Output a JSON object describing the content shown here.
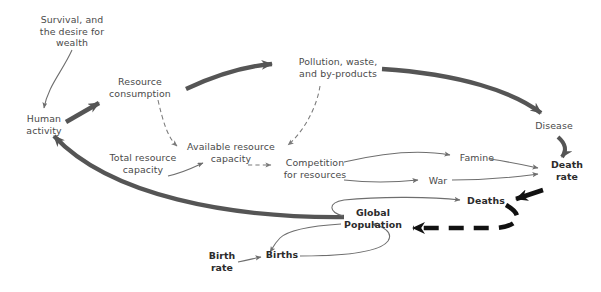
{
  "diagram": {
    "canvas": {
      "width": 601,
      "height": 292
    },
    "colors": {
      "background": "#ffffff",
      "thin_line": "#6e6e6e",
      "thick_gray": "#555555",
      "thick_black": "#111111",
      "dashed_line": "#7a7a7a",
      "text": "#4a4a4a",
      "text_bold": "#1d1d1d"
    },
    "nodes": [
      {
        "id": "survival",
        "label": "Survival, and\nthe desire for\nwealth",
        "x": 26,
        "y": 14,
        "w": 92,
        "weight": "normal"
      },
      {
        "id": "resource_cons",
        "label": "Resource\nconsumption",
        "x": 100,
        "y": 76,
        "w": 80,
        "weight": "normal"
      },
      {
        "id": "pollution",
        "label": "Pollution, waste,\nand by-products",
        "x": 288,
        "y": 56,
        "w": 100,
        "weight": "normal"
      },
      {
        "id": "human_act",
        "label": "Human\nactivity",
        "x": 18,
        "y": 113,
        "w": 52,
        "weight": "normal"
      },
      {
        "id": "disease",
        "label": "Disease",
        "x": 530,
        "y": 120,
        "w": 48,
        "weight": "normal"
      },
      {
        "id": "avail_res",
        "label": "Available resource\ncapacity",
        "x": 180,
        "y": 141,
        "w": 102,
        "weight": "normal"
      },
      {
        "id": "total_res",
        "label": "Total resource\ncapacity",
        "x": 103,
        "y": 152,
        "w": 80,
        "weight": "normal"
      },
      {
        "id": "competition",
        "label": "Competition\nfor resources",
        "x": 276,
        "y": 157,
        "w": 78,
        "weight": "normal"
      },
      {
        "id": "famine",
        "label": "Famine",
        "x": 456,
        "y": 152,
        "w": 42,
        "weight": "normal"
      },
      {
        "id": "war",
        "label": "War",
        "x": 424,
        "y": 175,
        "w": 28,
        "weight": "normal"
      },
      {
        "id": "death_rate",
        "label": "Death\nrate",
        "x": 546,
        "y": 159,
        "w": 42,
        "weight": "bold"
      },
      {
        "id": "deaths",
        "label": "Deaths",
        "x": 465,
        "y": 195,
        "w": 42,
        "weight": "bold"
      },
      {
        "id": "global_pop",
        "label": "Global\nPopulation",
        "x": 339,
        "y": 207,
        "w": 68,
        "weight": "bold"
      },
      {
        "id": "births",
        "label": "Births",
        "x": 265,
        "y": 249,
        "w": 34,
        "weight": "bold"
      },
      {
        "id": "birth_rate",
        "label": "Birth\nrate",
        "x": 205,
        "y": 250,
        "w": 34,
        "weight": "bold"
      }
    ],
    "edges": [
      {
        "id": "e-survival-human",
        "from": "survival",
        "to": "human_act",
        "style": "thin-solid",
        "note": "Survival and desire for wealth drives human activity"
      },
      {
        "id": "e-human-resource",
        "from": "human_act",
        "to": "resource_cons",
        "style": "thick-gray",
        "note": "Human activity drives resource consumption"
      },
      {
        "id": "e-resource-pollution",
        "from": "resource_cons",
        "to": "pollution",
        "style": "thick-gray",
        "note": "Resource consumption creates pollution, waste and by-products"
      },
      {
        "id": "e-pollution-disease",
        "from": "pollution",
        "to": "disease",
        "style": "thick-gray",
        "note": "Pollution leads to disease"
      },
      {
        "id": "e-disease-deathrate",
        "from": "disease",
        "to": "death_rate",
        "style": "thick-gray",
        "note": "Disease raises the death rate"
      },
      {
        "id": "e-resource-available",
        "from": "resource_cons",
        "to": "avail_res",
        "style": "thin-dashed",
        "note": "Resource consumption reduces available resource capacity"
      },
      {
        "id": "e-pollution-available",
        "from": "pollution",
        "to": "avail_res",
        "style": "thin-dashed",
        "note": "Pollution reduces available resource capacity"
      },
      {
        "id": "e-total-available",
        "from": "total_res",
        "to": "avail_res",
        "style": "thin-solid",
        "note": "Total resource capacity sets available resource capacity"
      },
      {
        "id": "e-available-competition",
        "from": "avail_res",
        "to": "competition",
        "style": "thin-dashed",
        "note": "Lower available capacity increases competition for resources"
      },
      {
        "id": "e-competition-famine",
        "from": "competition",
        "to": "famine",
        "style": "thin-solid",
        "note": "Competition for resources causes famine"
      },
      {
        "id": "e-competition-war",
        "from": "competition",
        "to": "war",
        "style": "thin-solid",
        "note": "Competition for resources causes war"
      },
      {
        "id": "e-famine-deathrate",
        "from": "famine",
        "to": "death_rate",
        "style": "thin-solid",
        "note": "Famine raises the death rate"
      },
      {
        "id": "e-war-deathrate",
        "from": "war",
        "to": "death_rate",
        "style": "thin-solid",
        "note": "War raises the death rate"
      },
      {
        "id": "e-deathrate-deaths",
        "from": "death_rate",
        "to": "deaths",
        "style": "thick-black",
        "note": "Death rate produces deaths"
      },
      {
        "id": "e-deaths-population",
        "from": "deaths",
        "to": "global_pop",
        "style": "thick-dashed",
        "note": "Deaths reduce global population"
      },
      {
        "id": "e-population-deaths",
        "from": "global_pop",
        "to": "deaths",
        "style": "thin-solid",
        "note": "Global population feeds deaths"
      },
      {
        "id": "e-population-births",
        "from": "global_pop",
        "to": "births",
        "style": "thin-solid",
        "note": "Global population feeds births"
      },
      {
        "id": "e-births-population",
        "from": "births",
        "to": "global_pop",
        "style": "thin-solid",
        "note": "Births increase global population"
      },
      {
        "id": "e-birthrate-births",
        "from": "birth_rate",
        "to": "births",
        "style": "thin-solid",
        "note": "Birth rate produces births"
      },
      {
        "id": "e-population-human",
        "from": "global_pop",
        "to": "human_act",
        "style": "thick-gray",
        "note": "Global population drives human activity"
      }
    ]
  }
}
